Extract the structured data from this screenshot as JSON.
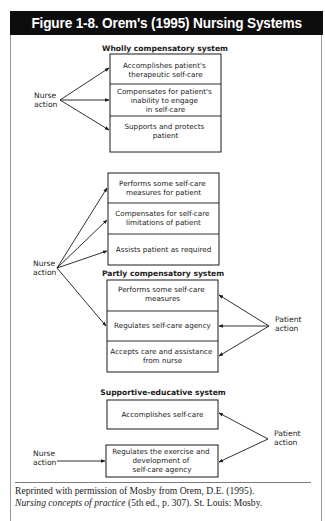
{
  "figure": {
    "title": "Figure 1-8. Orem's (1995) Nursing Systems",
    "title_bar_color": "#0d0d0d"
  },
  "wholly": {
    "title": "Wholly compensatory system",
    "nurse_label": [
      "Nurse",
      "action"
    ],
    "boxes": [
      [
        "Accomplishes patient's",
        "therapeutic self-care"
      ],
      [
        "Compensates for patient's",
        "inability to engage",
        "in self-care"
      ],
      [
        "Supports and protects",
        "patient"
      ]
    ]
  },
  "partly": {
    "title": "Partly compensatory system",
    "nurse_label": [
      "Nurse",
      "action"
    ],
    "patient_label": [
      "Patient",
      "action"
    ],
    "nurse_boxes": [
      [
        "Performs some self-care",
        "measures for patient"
      ],
      [
        "Compensates for self-care",
        "limitations of patient"
      ],
      [
        "Assists patient as required"
      ]
    ],
    "patient_boxes": [
      [
        "Performs some self-care",
        "measures"
      ],
      [
        "Regulates self-care agency"
      ],
      [
        "Accepts care and assistance",
        "from nurse"
      ]
    ]
  },
  "supportive": {
    "title": "Supportive-educative system",
    "nurse_label": [
      "Nurse",
      "action"
    ],
    "patient_label": [
      "Patient",
      "action"
    ],
    "boxes": [
      [
        "Accomplishes self-care"
      ],
      [
        "Regulates the exercise and",
        "development of",
        "self-care agency"
      ]
    ]
  },
  "footer": {
    "line1": "Reprinted with permission of Mosby from Orem, D.E. (1995).",
    "line2_italic": "Nursing concepts of practice",
    "line2_rest": " (5th ed., p. 307). St. Louis: Mosby."
  }
}
